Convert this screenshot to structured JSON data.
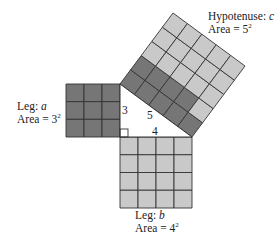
{
  "colors": {
    "dark": "#767676",
    "light": "#c9c9c9",
    "grid": "#333333"
  },
  "labels": {
    "hyp_title": "Hypotenuse: ",
    "hyp_var": "c",
    "hyp_area": "Area = 5",
    "hyp_exp": "2",
    "a_title": "Leg: ",
    "a_var": "a",
    "a_area": "Area = 3",
    "a_exp": "2",
    "b_title": "Leg: ",
    "b_var": "b",
    "b_area": "Area = 4",
    "b_exp": "2",
    "side_a": "3",
    "side_c": "5",
    "side_b": "4"
  },
  "squares": {
    "leg_a": {
      "side": 3,
      "cells_dark": 9
    },
    "leg_b": {
      "side": 4,
      "cells_light": 16
    },
    "hypotenuse": {
      "side": 5,
      "cells_dark": 9,
      "cells_light": 16
    }
  }
}
